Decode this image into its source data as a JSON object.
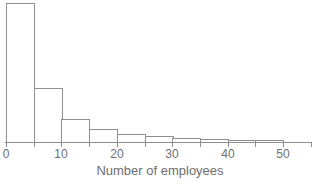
{
  "chart_data": {
    "type": "bar",
    "subtype": "histogram",
    "title": "",
    "xlabel": "Number of employees",
    "ylabel": "",
    "xlim": [
      0,
      55
    ],
    "x_tick_step": 5,
    "x_tick_labels": [
      0,
      10,
      20,
      30,
      40,
      50
    ],
    "bin_width": 5,
    "y_axis_visible": false,
    "legend": "none",
    "grid": false,
    "bins": [
      {
        "range": [
          0,
          5
        ],
        "rel_height": 100
      },
      {
        "range": [
          5,
          10
        ],
        "rel_height": 38.8
      },
      {
        "range": [
          10,
          15
        ],
        "rel_height": 16.5
      },
      {
        "range": [
          15,
          20
        ],
        "rel_height": 9.4
      },
      {
        "range": [
          20,
          25
        ],
        "rel_height": 5.8
      },
      {
        "range": [
          25,
          30
        ],
        "rel_height": 4.0
      },
      {
        "range": [
          30,
          35
        ],
        "rel_height": 2.9
      },
      {
        "range": [
          35,
          40
        ],
        "rel_height": 2.2
      },
      {
        "range": [
          40,
          45
        ],
        "rel_height": 1.4
      },
      {
        "range": [
          45,
          50
        ],
        "rel_height": 1.1
      }
    ],
    "colors": {
      "background": "#ffffff",
      "bar_fill": "#ffffff",
      "bar_border": "#8f8f8f",
      "axis": "#8f8f8f",
      "text": "#6e6e6e"
    }
  }
}
